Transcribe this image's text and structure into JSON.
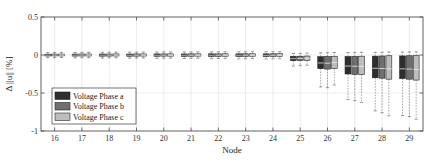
{
  "chart_data": {
    "type": "box",
    "title": "",
    "xlabel": "Node",
    "ylabel": "Δ ||u|| [%]",
    "categories": [
      "16",
      "17",
      "18",
      "19",
      "20",
      "21",
      "22",
      "23",
      "24",
      "25",
      "26",
      "27",
      "28",
      "29"
    ],
    "xtick_labels": [
      "16",
      "17",
      "18",
      "19",
      "20",
      "21",
      "22",
      "23",
      "24",
      "25",
      "26",
      "27",
      "28",
      "29"
    ],
    "ytick_labels": [
      "0.5",
      "0",
      "-0.5",
      "-1"
    ],
    "ytick_values": [
      0.5,
      0,
      -0.5,
      -1
    ],
    "ylim": [
      -1,
      0.5
    ],
    "xlim": [
      15.5,
      29.5
    ],
    "grid": true,
    "legend_position": "lower-left",
    "legend": [
      "Voltage Phase a",
      "Voltage Phase b",
      "Voltage Phase c"
    ],
    "colors": {
      "phase_a": "#2e2e2e",
      "phase_b": "#6f6f6f",
      "phase_c": "#bdbdbd",
      "axis": "#3a3a3a",
      "grid": "#d9d9d9",
      "background": "#ffffff"
    },
    "series": [
      {
        "name": "Voltage Phase a",
        "color": "#2e2e2e",
        "boxes": [
          {
            "node": "16",
            "whisker_low": -0.035,
            "q1": -0.013,
            "median": -0.002,
            "q3": 0.011,
            "whisker_high": 0.032
          },
          {
            "node": "17",
            "whisker_low": -0.038,
            "q1": -0.014,
            "median": -0.002,
            "q3": 0.012,
            "whisker_high": 0.034
          },
          {
            "node": "18",
            "whisker_low": -0.04,
            "q1": -0.015,
            "median": -0.002,
            "q3": 0.013,
            "whisker_high": 0.036
          },
          {
            "node": "19",
            "whisker_low": -0.042,
            "q1": -0.016,
            "median": -0.003,
            "q3": 0.013,
            "whisker_high": 0.038
          },
          {
            "node": "20",
            "whisker_low": -0.044,
            "q1": -0.016,
            "median": -0.003,
            "q3": 0.014,
            "whisker_high": 0.039
          },
          {
            "node": "21",
            "whisker_low": -0.046,
            "q1": -0.017,
            "median": -0.003,
            "q3": 0.014,
            "whisker_high": 0.04
          },
          {
            "node": "22",
            "whisker_low": -0.048,
            "q1": -0.018,
            "median": -0.003,
            "q3": 0.015,
            "whisker_high": 0.041
          },
          {
            "node": "23",
            "whisker_low": -0.05,
            "q1": -0.018,
            "median": -0.003,
            "q3": 0.015,
            "whisker_high": 0.042
          },
          {
            "node": "24",
            "whisker_low": -0.052,
            "q1": -0.019,
            "median": -0.004,
            "q3": 0.015,
            "whisker_high": 0.043
          },
          {
            "node": "25",
            "whisker_low": -0.145,
            "q1": -0.075,
            "median": -0.048,
            "q3": -0.018,
            "whisker_high": 0.02
          },
          {
            "node": "26",
            "whisker_low": -0.42,
            "q1": -0.18,
            "median": -0.105,
            "q3": -0.022,
            "whisker_high": 0.028
          },
          {
            "node": "27",
            "whisker_low": -0.585,
            "q1": -0.25,
            "median": -0.145,
            "q3": -0.02,
            "whisker_high": 0.032
          },
          {
            "node": "28",
            "whisker_low": -0.735,
            "q1": -0.3,
            "median": -0.175,
            "q3": -0.015,
            "whisker_high": 0.035
          },
          {
            "node": "29",
            "whisker_low": -0.795,
            "q1": -0.31,
            "median": -0.182,
            "q3": -0.012,
            "whisker_high": 0.038
          }
        ]
      },
      {
        "name": "Voltage Phase b",
        "color": "#6f6f6f",
        "boxes": [
          {
            "node": "16",
            "whisker_low": -0.034,
            "q1": -0.012,
            "median": -0.001,
            "q3": 0.012,
            "whisker_high": 0.033
          },
          {
            "node": "17",
            "whisker_low": -0.036,
            "q1": -0.013,
            "median": -0.001,
            "q3": 0.013,
            "whisker_high": 0.035
          },
          {
            "node": "18",
            "whisker_low": -0.038,
            "q1": -0.014,
            "median": -0.001,
            "q3": 0.013,
            "whisker_high": 0.037
          },
          {
            "node": "19",
            "whisker_low": -0.04,
            "q1": -0.015,
            "median": -0.002,
            "q3": 0.014,
            "whisker_high": 0.038
          },
          {
            "node": "20",
            "whisker_low": -0.042,
            "q1": -0.015,
            "median": -0.002,
            "q3": 0.014,
            "whisker_high": 0.04
          },
          {
            "node": "21",
            "whisker_low": -0.044,
            "q1": -0.016,
            "median": -0.002,
            "q3": 0.015,
            "whisker_high": 0.041
          },
          {
            "node": "22",
            "whisker_low": -0.046,
            "q1": -0.017,
            "median": -0.002,
            "q3": 0.015,
            "whisker_high": 0.042
          },
          {
            "node": "23",
            "whisker_low": -0.048,
            "q1": -0.017,
            "median": -0.002,
            "q3": 0.016,
            "whisker_high": 0.043
          },
          {
            "node": "24",
            "whisker_low": -0.05,
            "q1": -0.018,
            "median": -0.003,
            "q3": 0.016,
            "whisker_high": 0.044
          },
          {
            "node": "25",
            "whisker_low": -0.14,
            "q1": -0.072,
            "median": -0.045,
            "q3": -0.016,
            "whisker_high": 0.022
          },
          {
            "node": "26",
            "whisker_low": -0.43,
            "q1": -0.185,
            "median": -0.108,
            "q3": -0.02,
            "whisker_high": 0.03
          },
          {
            "node": "27",
            "whisker_low": -0.6,
            "q1": -0.255,
            "median": -0.148,
            "q3": -0.018,
            "whisker_high": 0.034
          },
          {
            "node": "28",
            "whisker_low": -0.76,
            "q1": -0.305,
            "median": -0.178,
            "q3": -0.013,
            "whisker_high": 0.037
          },
          {
            "node": "29",
            "whisker_low": -0.81,
            "q1": -0.318,
            "median": -0.185,
            "q3": -0.01,
            "whisker_high": 0.04
          }
        ]
      },
      {
        "name": "Voltage Phase c",
        "color": "#bdbdbd",
        "boxes": [
          {
            "node": "16",
            "whisker_low": -0.033,
            "q1": -0.012,
            "median": -0.001,
            "q3": 0.012,
            "whisker_high": 0.034
          },
          {
            "node": "17",
            "whisker_low": -0.035,
            "q1": -0.013,
            "median": -0.001,
            "q3": 0.013,
            "whisker_high": 0.036
          },
          {
            "node": "18",
            "whisker_low": -0.037,
            "q1": -0.013,
            "median": -0.001,
            "q3": 0.014,
            "whisker_high": 0.038
          },
          {
            "node": "19",
            "whisker_low": -0.039,
            "q1": -0.014,
            "median": -0.001,
            "q3": 0.014,
            "whisker_high": 0.039
          },
          {
            "node": "20",
            "whisker_low": -0.041,
            "q1": -0.015,
            "median": -0.002,
            "q3": 0.015,
            "whisker_high": 0.041
          },
          {
            "node": "21",
            "whisker_low": -0.043,
            "q1": -0.015,
            "median": -0.002,
            "q3": 0.015,
            "whisker_high": 0.042
          },
          {
            "node": "22",
            "whisker_low": -0.045,
            "q1": -0.016,
            "median": -0.002,
            "q3": 0.016,
            "whisker_high": 0.043
          },
          {
            "node": "23",
            "whisker_low": -0.047,
            "q1": -0.016,
            "median": -0.002,
            "q3": 0.016,
            "whisker_high": 0.044
          },
          {
            "node": "24",
            "whisker_low": -0.049,
            "q1": -0.017,
            "median": -0.002,
            "q3": 0.017,
            "whisker_high": 0.045
          },
          {
            "node": "25",
            "whisker_low": -0.135,
            "q1": -0.07,
            "median": -0.042,
            "q3": -0.014,
            "whisker_high": 0.024
          },
          {
            "node": "26",
            "whisker_low": -0.395,
            "q1": -0.178,
            "median": -0.1,
            "q3": -0.018,
            "whisker_high": 0.032
          },
          {
            "node": "27",
            "whisker_low": -0.625,
            "q1": -0.258,
            "median": -0.15,
            "q3": -0.016,
            "whisker_high": 0.036
          },
          {
            "node": "28",
            "whisker_low": -0.8,
            "q1": -0.318,
            "median": -0.182,
            "q3": -0.01,
            "whisker_high": 0.039
          },
          {
            "node": "29",
            "whisker_low": -0.845,
            "q1": -0.33,
            "median": -0.19,
            "q3": -0.008,
            "whisker_high": 0.042
          }
        ]
      }
    ]
  }
}
